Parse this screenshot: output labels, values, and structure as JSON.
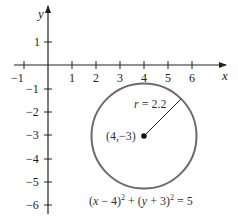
{
  "diagram": {
    "type": "coordinate-plane-circle",
    "axes": {
      "x_label": "x",
      "y_label": "y",
      "x_ticks": [
        "−1",
        "1",
        "2",
        "3",
        "4",
        "5",
        "6"
      ],
      "y_ticks": [
        "1",
        "−1",
        "−2",
        "−3",
        "−4",
        "−5",
        "−6"
      ]
    },
    "circle": {
      "center_label": "(4,−3)",
      "radius_label": "r = 2.2",
      "equation": {
        "part1": "(x − 4)",
        "exp1": "2",
        "part2": " + (y + 3)",
        "exp2": "2",
        "part3": " = 5"
      },
      "stroke_color": "#6b6b6b"
    }
  }
}
